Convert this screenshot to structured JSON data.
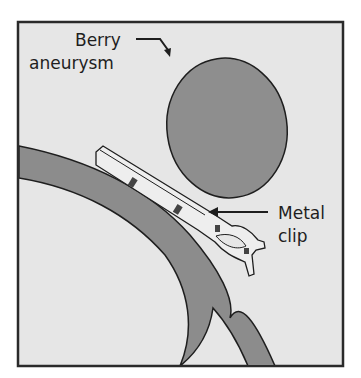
{
  "diagram": {
    "labels": {
      "aneurysm_line1": "Berry",
      "aneurysm_line2": "aneurysm",
      "clip_line1": "Metal",
      "clip_line2": "clip"
    },
    "colors": {
      "background": "#e6e6e6",
      "frame": "#2a2a2a",
      "vessel": "#8c8c8c",
      "aneurysm": "#8e8e8e",
      "clip": "#eeeeee",
      "outline": "#1e1e1e"
    }
  }
}
